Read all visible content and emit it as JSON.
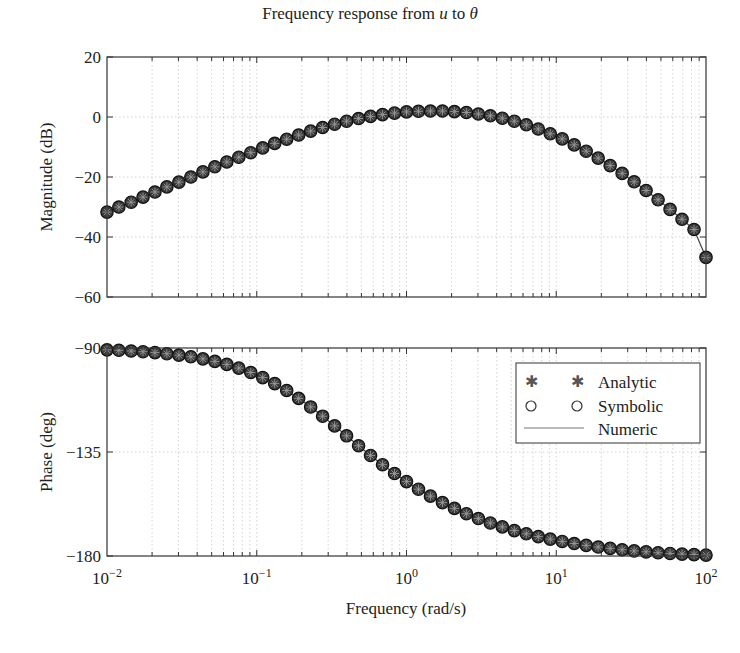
{
  "chart_data": {
    "type": "line",
    "title": "Frequency response from u to θ",
    "title_parts": {
      "prefix": "Frequency response from ",
      "u": "u",
      "mid": " to ",
      "theta": "θ"
    },
    "xlabel": "Frequency  (rad/s)",
    "xscale": "log",
    "xlim": [
      0.01,
      100
    ],
    "x_ticks": [
      {
        "base": "10",
        "exp": "−2"
      },
      {
        "base": "10",
        "exp": "−1"
      },
      {
        "base": "10",
        "exp": "0"
      },
      {
        "base": "10",
        "exp": "1"
      },
      {
        "base": "10",
        "exp": "2"
      }
    ],
    "grid": true,
    "subplots": [
      {
        "name": "magnitude",
        "ylabel": "Magnitude (dB)",
        "ylim": [
          -60,
          20
        ],
        "y_ticks": [
          "20",
          "0",
          "−20",
          "−40",
          "−60"
        ],
        "y_tick_values": [
          20,
          0,
          -20,
          -40,
          -60
        ]
      },
      {
        "name": "phase",
        "ylabel": "Phase (deg)",
        "ylim": [
          -180,
          -90
        ],
        "y_ticks": [
          "−90",
          "−135",
          "−180"
        ],
        "y_tick_values": [
          -90,
          -135,
          -180
        ],
        "legend": {
          "position": "upper right",
          "entries": [
            {
              "label": "Analytic",
              "marker": "*"
            },
            {
              "label": "Symbolic",
              "marker": "o"
            },
            {
              "label": "Numeric",
              "marker": "line"
            }
          ]
        }
      }
    ],
    "x": [
      0.01,
      0.012,
      0.0145,
      0.0174,
      0.0209,
      0.0251,
      0.0302,
      0.0363,
      0.0437,
      0.0525,
      0.0631,
      0.0759,
      0.0912,
      0.1096,
      0.1318,
      0.1585,
      0.1905,
      0.2291,
      0.2754,
      0.3311,
      0.3981,
      0.4786,
      0.5754,
      0.6918,
      0.8318,
      1.0,
      1.2023,
      1.4454,
      1.7378,
      2.0893,
      2.5119,
      3.02,
      3.6308,
      4.3652,
      5.2481,
      6.3096,
      7.5858,
      9.1201,
      10.965,
      13.183,
      15.849,
      19.055,
      22.909,
      27.542,
      33.113,
      39.811,
      47.863,
      57.544,
      69.183,
      83.176,
      100
    ],
    "series": [
      {
        "name": "Magnitude (dB)",
        "subplot": "magnitude",
        "values": [
          -31.7,
          -30.0,
          -28.4,
          -26.7,
          -25.0,
          -23.3,
          -21.7,
          -20.0,
          -18.3,
          -16.6,
          -15.0,
          -13.4,
          -11.9,
          -10.3,
          -8.8,
          -7.4,
          -6.0,
          -4.7,
          -3.5,
          -2.4,
          -1.4,
          -0.5,
          0.2,
          0.8,
          1.3,
          1.7,
          1.9,
          2.0,
          2.0,
          1.8,
          1.5,
          1.0,
          0.4,
          -0.4,
          -1.4,
          -2.6,
          -4.0,
          -5.6,
          -7.3,
          -9.3,
          -11.4,
          -13.7,
          -16.2,
          -18.8,
          -21.6,
          -24.5,
          -27.6,
          -30.8,
          -34.1,
          -37.5,
          -46.8
        ]
      },
      {
        "name": "Phase (deg)",
        "subplot": "phase",
        "values": [
          -90.8,
          -91.0,
          -91.3,
          -91.6,
          -92.0,
          -92.5,
          -93.1,
          -93.8,
          -94.7,
          -95.8,
          -97.1,
          -98.7,
          -100.6,
          -102.8,
          -105.4,
          -108.4,
          -111.8,
          -115.5,
          -119.5,
          -123.7,
          -128.0,
          -132.3,
          -136.5,
          -140.5,
          -144.3,
          -147.8,
          -151.1,
          -154.1,
          -156.9,
          -159.4,
          -161.7,
          -163.8,
          -165.7,
          -167.4,
          -169.0,
          -170.4,
          -171.6,
          -172.7,
          -173.7,
          -174.6,
          -175.4,
          -176.1,
          -176.7,
          -177.3,
          -177.8,
          -178.2,
          -178.6,
          -178.9,
          -179.2,
          -179.4,
          -179.6
        ]
      }
    ],
    "series_display": [
      "Analytic",
      "Symbolic",
      "Numeric"
    ]
  }
}
